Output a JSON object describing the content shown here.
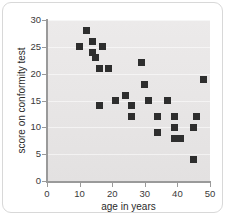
{
  "chart_data": {
    "type": "scatter",
    "title": "",
    "xlabel": "age in years",
    "ylabel": "score on conformity test",
    "xlim": [
      0,
      50
    ],
    "ylim": [
      0,
      30
    ],
    "xticks": [
      0,
      10,
      20,
      30,
      40,
      50
    ],
    "yticks": [
      0,
      5,
      10,
      15,
      20,
      25,
      30
    ],
    "grid": true,
    "legend": null,
    "marker": "square",
    "marker_color": "#2e2e2e",
    "plot_background": "#e9e7e7",
    "series": [
      {
        "name": "conformity score vs age",
        "points": [
          {
            "x": 10,
            "y": 25
          },
          {
            "x": 12,
            "y": 28
          },
          {
            "x": 14,
            "y": 26
          },
          {
            "x": 14,
            "y": 24
          },
          {
            "x": 15,
            "y": 23
          },
          {
            "x": 16,
            "y": 21
          },
          {
            "x": 17,
            "y": 25
          },
          {
            "x": 16,
            "y": 14
          },
          {
            "x": 19,
            "y": 21
          },
          {
            "x": 21,
            "y": 15
          },
          {
            "x": 24,
            "y": 16
          },
          {
            "x": 26,
            "y": 14
          },
          {
            "x": 26,
            "y": 12
          },
          {
            "x": 29,
            "y": 22
          },
          {
            "x": 30,
            "y": 18
          },
          {
            "x": 31,
            "y": 15
          },
          {
            "x": 34,
            "y": 12
          },
          {
            "x": 34,
            "y": 9
          },
          {
            "x": 37,
            "y": 15
          },
          {
            "x": 39,
            "y": 12
          },
          {
            "x": 39,
            "y": 10
          },
          {
            "x": 39,
            "y": 8
          },
          {
            "x": 41,
            "y": 8
          },
          {
            "x": 45,
            "y": 10
          },
          {
            "x": 45,
            "y": 4
          },
          {
            "x": 46,
            "y": 12
          },
          {
            "x": 48,
            "y": 19
          }
        ]
      }
    ]
  },
  "axes": {
    "x_title": "age in years",
    "y_title": "score on conformity test",
    "x_tick_labels": [
      "0",
      "10",
      "20",
      "30",
      "40",
      "50"
    ],
    "y_tick_labels": [
      "0",
      "5",
      "10",
      "15",
      "20",
      "25",
      "30"
    ]
  }
}
